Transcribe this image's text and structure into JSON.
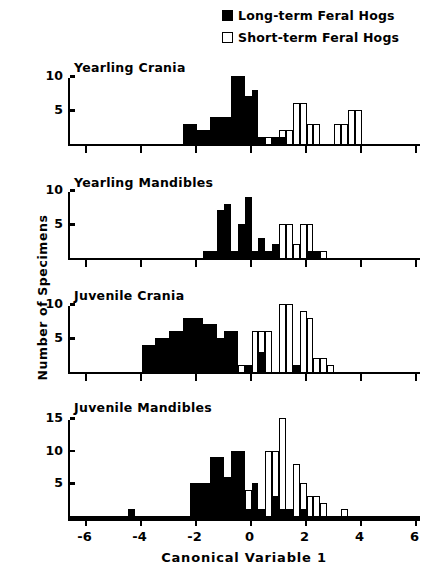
{
  "legend": {
    "items": [
      {
        "label": "Long-term Feral Hogs",
        "marker": "filled-square-icon",
        "color": "#000000"
      },
      {
        "label": "Short-term Feral Hogs",
        "marker": "open-square-icon",
        "color": "#ffffff"
      }
    ]
  },
  "axis": {
    "ylabel": "Number of Specimens",
    "xlabel": "Canonical Variable 1",
    "xticks": [
      -6,
      -4,
      -2,
      0,
      2,
      4,
      6
    ],
    "xticklabels": [
      "-6",
      "-4",
      "-2",
      "0",
      "2",
      "4",
      "6"
    ],
    "xlim": [
      -6.6,
      6.2
    ]
  },
  "chart_data": [
    {
      "type": "bar",
      "title": "Yearling Crania",
      "xlabel": "Canonical Variable 1",
      "ylabel": "Number of Specimens",
      "xlim": [
        -6.6,
        6.2
      ],
      "ylim": [
        0,
        10
      ],
      "yticks": [
        5,
        10
      ],
      "yticklabels": [
        "5",
        "10"
      ],
      "grid": false,
      "bin_width": 0.25,
      "series": [
        {
          "name": "Long-term Feral Hogs",
          "fill": "#000000",
          "bins": [
            {
              "x": -2.5,
              "value": 3
            },
            {
              "x": -2.25,
              "value": 3
            },
            {
              "x": -2.0,
              "value": 2
            },
            {
              "x": -1.75,
              "value": 2
            },
            {
              "x": -1.5,
              "value": 4
            },
            {
              "x": -1.25,
              "value": 4
            },
            {
              "x": -1.0,
              "value": 4
            },
            {
              "x": -0.75,
              "value": 10
            },
            {
              "x": -0.5,
              "value": 10
            },
            {
              "x": -0.25,
              "value": 7
            },
            {
              "x": 0.0,
              "value": 8
            },
            {
              "x": 0.25,
              "value": 1
            },
            {
              "x": 0.75,
              "value": 1
            },
            {
              "x": 1.0,
              "value": 1
            }
          ]
        },
        {
          "name": "Short-term Feral Hogs",
          "fill": "#ffffff",
          "bins": [
            {
              "x": 0.5,
              "value": 1
            },
            {
              "x": 1.0,
              "value": 2
            },
            {
              "x": 1.25,
              "value": 2
            },
            {
              "x": 1.5,
              "value": 6
            },
            {
              "x": 1.75,
              "value": 6
            },
            {
              "x": 2.0,
              "value": 3
            },
            {
              "x": 2.25,
              "value": 3
            },
            {
              "x": 3.0,
              "value": 3
            },
            {
              "x": 3.25,
              "value": 3
            },
            {
              "x": 3.5,
              "value": 5
            },
            {
              "x": 3.75,
              "value": 5
            }
          ]
        }
      ]
    },
    {
      "type": "bar",
      "title": "Yearling Mandibles",
      "xlabel": "Canonical Variable 1",
      "ylabel": "Number of Specimens",
      "xlim": [
        -6.6,
        6.2
      ],
      "ylim": [
        0,
        10
      ],
      "yticks": [
        5,
        10
      ],
      "yticklabels": [
        "5",
        "10"
      ],
      "grid": false,
      "bin_width": 0.25,
      "series": [
        {
          "name": "Long-term Feral Hogs",
          "fill": "#000000",
          "bins": [
            {
              "x": -1.75,
              "value": 1
            },
            {
              "x": -1.5,
              "value": 1
            },
            {
              "x": -1.25,
              "value": 7
            },
            {
              "x": -1.0,
              "value": 8
            },
            {
              "x": -0.75,
              "value": 1
            },
            {
              "x": -0.5,
              "value": 5
            },
            {
              "x": -0.25,
              "value": 9
            },
            {
              "x": 0.0,
              "value": 1
            },
            {
              "x": 0.25,
              "value": 3
            },
            {
              "x": 0.5,
              "value": 1
            },
            {
              "x": 0.75,
              "value": 2
            },
            {
              "x": 2.0,
              "value": 1
            },
            {
              "x": 2.25,
              "value": 1
            }
          ]
        },
        {
          "name": "Short-term Feral Hogs",
          "fill": "#ffffff",
          "bins": [
            {
              "x": 0.75,
              "value": 2
            },
            {
              "x": 1.0,
              "value": 5
            },
            {
              "x": 1.25,
              "value": 5
            },
            {
              "x": 1.5,
              "value": 2
            },
            {
              "x": 1.75,
              "value": 5
            },
            {
              "x": 2.0,
              "value": 5
            },
            {
              "x": 2.5,
              "value": 1
            }
          ]
        }
      ]
    },
    {
      "type": "bar",
      "title": "Juvenile Crania",
      "xlabel": "Canonical Variable 1",
      "ylabel": "Number of Specimens",
      "xlim": [
        -6.6,
        6.2
      ],
      "ylim": [
        0,
        10
      ],
      "yticks": [
        5,
        10
      ],
      "yticklabels": [
        "5",
        "10"
      ],
      "grid": false,
      "bin_width": 0.25,
      "series": [
        {
          "name": "Long-term Feral Hogs",
          "fill": "#000000",
          "bins": [
            {
              "x": -4.0,
              "value": 4
            },
            {
              "x": -3.75,
              "value": 4
            },
            {
              "x": -3.5,
              "value": 5
            },
            {
              "x": -3.25,
              "value": 5
            },
            {
              "x": -3.0,
              "value": 6
            },
            {
              "x": -2.75,
              "value": 6
            },
            {
              "x": -2.5,
              "value": 8
            },
            {
              "x": -2.25,
              "value": 8
            },
            {
              "x": -2.0,
              "value": 8
            },
            {
              "x": -1.75,
              "value": 7
            },
            {
              "x": -1.5,
              "value": 7
            },
            {
              "x": -1.25,
              "value": 5
            },
            {
              "x": -1.0,
              "value": 6
            },
            {
              "x": -0.75,
              "value": 6
            },
            {
              "x": -0.25,
              "value": 1
            },
            {
              "x": 0.25,
              "value": 3
            },
            {
              "x": 1.5,
              "value": 1
            }
          ]
        },
        {
          "name": "Short-term Feral Hogs",
          "fill": "#ffffff",
          "bins": [
            {
              "x": -0.5,
              "value": 1
            },
            {
              "x": 0.0,
              "value": 6
            },
            {
              "x": 0.25,
              "value": 6
            },
            {
              "x": 0.5,
              "value": 6
            },
            {
              "x": 1.0,
              "value": 10
            },
            {
              "x": 1.25,
              "value": 10
            },
            {
              "x": 1.75,
              "value": 9
            },
            {
              "x": 2.0,
              "value": 8
            },
            {
              "x": 2.25,
              "value": 2
            },
            {
              "x": 2.5,
              "value": 2
            },
            {
              "x": 2.75,
              "value": 1
            }
          ]
        }
      ]
    },
    {
      "type": "bar",
      "title": "Juvenile Mandibles",
      "xlabel": "Canonical Variable 1",
      "ylabel": "Number of Specimens",
      "xlim": [
        -6.6,
        6.2
      ],
      "ylim": [
        0,
        15
      ],
      "yticks": [
        5,
        10,
        15
      ],
      "yticklabels": [
        "5",
        "10",
        "15"
      ],
      "grid": false,
      "bin_width": 0.25,
      "series": [
        {
          "name": "Long-term Feral Hogs",
          "fill": "#000000",
          "bins": [
            {
              "x": -4.5,
              "value": 1
            },
            {
              "x": -2.25,
              "value": 5
            },
            {
              "x": -2.0,
              "value": 5
            },
            {
              "x": -1.75,
              "value": 5
            },
            {
              "x": -1.5,
              "value": 9
            },
            {
              "x": -1.25,
              "value": 9
            },
            {
              "x": -1.0,
              "value": 6
            },
            {
              "x": -0.75,
              "value": 10
            },
            {
              "x": -0.5,
              "value": 10
            },
            {
              "x": -0.25,
              "value": 1
            },
            {
              "x": 0.0,
              "value": 5
            },
            {
              "x": 0.25,
              "value": 1
            },
            {
              "x": 0.75,
              "value": 3
            },
            {
              "x": 1.0,
              "value": 1
            },
            {
              "x": 1.25,
              "value": 1
            },
            {
              "x": 1.75,
              "value": 1
            }
          ]
        },
        {
          "name": "Short-term Feral Hogs",
          "fill": "#ffffff",
          "bins": [
            {
              "x": -0.25,
              "value": 4
            },
            {
              "x": 0.5,
              "value": 10
            },
            {
              "x": 0.75,
              "value": 10
            },
            {
              "x": 1.0,
              "value": 15
            },
            {
              "x": 1.5,
              "value": 8
            },
            {
              "x": 1.75,
              "value": 5
            },
            {
              "x": 2.0,
              "value": 3
            },
            {
              "x": 2.25,
              "value": 3
            },
            {
              "x": 2.5,
              "value": 2
            },
            {
              "x": 3.25,
              "value": 1
            }
          ]
        }
      ]
    }
  ]
}
